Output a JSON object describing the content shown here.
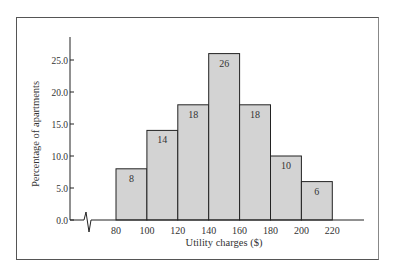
{
  "chart_data": {
    "type": "bar",
    "subtype": "histogram",
    "title": "",
    "xlabel": "Utility charges ($)",
    "ylabel": "Percentage of apartments",
    "bin_edges": [
      80,
      100,
      120,
      140,
      160,
      180,
      200,
      220
    ],
    "categories": [
      "80-100",
      "100-120",
      "120-140",
      "140-160",
      "160-180",
      "180-200",
      "200-220"
    ],
    "values": [
      8,
      14,
      18,
      26,
      18,
      10,
      6
    ],
    "data_labels": [
      "8",
      "14",
      "18",
      "26",
      "18",
      "10",
      "6"
    ],
    "x_tick_labels": [
      "80",
      "100",
      "120",
      "140",
      "160",
      "180",
      "200",
      "220"
    ],
    "y_tick_labels": [
      "0.0",
      "5.0",
      "10.0",
      "15.0",
      "20.0",
      "25.0"
    ],
    "y_ticks": [
      0,
      5,
      10,
      15,
      20,
      25
    ],
    "ylim": [
      0,
      28
    ],
    "xlim": [
      60,
      240
    ],
    "axis_break": "x-axis broken between 0 and 80",
    "grid": false,
    "legend": null,
    "bar_color": "#d3d3d3",
    "edge_color": "#222222"
  }
}
